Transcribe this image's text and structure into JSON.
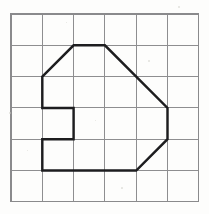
{
  "figure": {
    "background_color": "#fdfdfc",
    "grid": {
      "name": "square-grid",
      "columns": 6,
      "rows": 6,
      "cell_size_px": 31.3,
      "origin_x_px": 11,
      "origin_y_px": 14,
      "line_color": "#8e8e90",
      "border_color": "#8a8a8c",
      "show_grid": true,
      "vertical_lines_x": [
        11,
        42.3,
        73.6,
        104.9,
        136.2,
        167.5,
        198.8
      ],
      "horizontal_lines_y": [
        14,
        45.3,
        76.6,
        107.9,
        139.2,
        170.5,
        201.8
      ]
    },
    "polygon": {
      "name": "outlined-polygon",
      "stroke_color": "#1d1d1f",
      "stroke_width_px": 2.45,
      "fill": "none",
      "closed": true,
      "vertex_count": 11,
      "vertices_grid": [
        [
          1,
          2
        ],
        [
          2,
          1
        ],
        [
          3,
          1
        ],
        [
          5,
          3
        ],
        [
          5,
          4
        ],
        [
          4,
          5
        ],
        [
          1,
          5
        ],
        [
          1,
          4
        ],
        [
          2,
          4
        ],
        [
          2,
          3
        ],
        [
          1,
          3
        ]
      ],
      "vertices_px": "42.3,76.6 73.6,45.3 104.9,45.3 167.5,107.9 167.5,139.2 136.2,170.5 42.3,170.5 42.3,139.2 73.6,139.2 73.6,107.9 42.3,107.9",
      "edges": [
        {
          "name": "upper-left-diagonal",
          "from": [
            1,
            2
          ],
          "to": [
            2,
            1
          ],
          "type": "diagonal"
        },
        {
          "name": "top-horizontal",
          "from": [
            2,
            1
          ],
          "to": [
            3,
            1
          ],
          "type": "horizontal"
        },
        {
          "name": "upper-right-diagonal",
          "from": [
            3,
            1
          ],
          "to": [
            5,
            3
          ],
          "type": "diagonal"
        },
        {
          "name": "right-vertical",
          "from": [
            5,
            3
          ],
          "to": [
            5,
            4
          ],
          "type": "vertical"
        },
        {
          "name": "lower-right-diagonal",
          "from": [
            5,
            4
          ],
          "to": [
            4,
            5
          ],
          "type": "diagonal"
        },
        {
          "name": "bottom-horizontal",
          "from": [
            4,
            5
          ],
          "to": [
            1,
            5
          ],
          "type": "horizontal"
        },
        {
          "name": "notch-lower-vertical",
          "from": [
            1,
            5
          ],
          "to": [
            1,
            4
          ],
          "type": "vertical"
        },
        {
          "name": "notch-bottom-horizontal",
          "from": [
            1,
            4
          ],
          "to": [
            2,
            4
          ],
          "type": "horizontal"
        },
        {
          "name": "notch-right-vertical",
          "from": [
            2,
            4
          ],
          "to": [
            2,
            3
          ],
          "type": "vertical"
        },
        {
          "name": "notch-top-horizontal",
          "from": [
            2,
            3
          ],
          "to": [
            1,
            3
          ],
          "type": "horizontal"
        },
        {
          "name": "notch-upper-vertical",
          "from": [
            1,
            3
          ],
          "to": [
            1,
            2
          ],
          "type": "vertical"
        }
      ]
    },
    "specks": [
      {
        "x": 9,
        "y": 112,
        "size": 1.6
      },
      {
        "x": 66,
        "y": 22,
        "size": 1.4
      },
      {
        "x": 148,
        "y": 60,
        "size": 1.5
      },
      {
        "x": 121,
        "y": 187,
        "size": 1.7
      },
      {
        "x": 27,
        "y": 150,
        "size": 1.3
      },
      {
        "x": 178,
        "y": 6,
        "size": 1.5
      },
      {
        "x": 95,
        "y": 120,
        "size": 1.2
      }
    ]
  }
}
